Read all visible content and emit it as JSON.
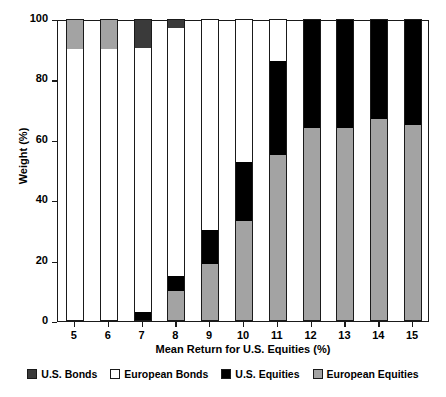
{
  "chart_data": {
    "type": "bar",
    "title": "",
    "subtitle": "",
    "xlabel": "Mean Return for U.S. Equities (%)",
    "ylabel": "Weight (%)",
    "stacked": true,
    "stack_normalized_to": 100,
    "grid": false,
    "legend_position": "bottom",
    "xlim": [
      4.5,
      15.5
    ],
    "ylim": [
      0,
      100
    ],
    "ytick_labels": [
      "0",
      "20",
      "40",
      "60",
      "80",
      "100"
    ],
    "ytick_values": [
      0,
      20,
      40,
      60,
      80,
      100
    ],
    "categories": [
      "5",
      "6",
      "7",
      "8",
      "9",
      "10",
      "11",
      "12",
      "13",
      "14",
      "15"
    ],
    "series": [
      {
        "name": "U.S. Bonds",
        "color": "#3a3a3a",
        "values": [
          0,
          0,
          9.5,
          3,
          0,
          0,
          0,
          0,
          0,
          0,
          0
        ]
      },
      {
        "name": "European Bonds",
        "color": "#ffffff",
        "values": [
          90,
          90,
          87.5,
          82,
          70,
          47.5,
          14,
          0,
          0,
          0,
          0
        ]
      },
      {
        "name": "U.S. Equities",
        "color": "#000000",
        "values": [
          0,
          0,
          3,
          5,
          11,
          19.5,
          31,
          36,
          36,
          33,
          35
        ]
      },
      {
        "name": "European Equities",
        "color": "#a3a3a3",
        "values": [
          10,
          10,
          0,
          10,
          19,
          33,
          55,
          64,
          64,
          67,
          65
        ]
      }
    ],
    "stack_order_bottom_to_top": [
      "U.S. Equities",
      "European Equities",
      "European Bonds",
      "U.S. Bonds"
    ],
    "bar_stacks": [
      {
        "x": "5",
        "segments": [
          {
            "series": "European Bonds",
            "from": 0,
            "to": 90
          },
          {
            "series": "European Equities",
            "from": 90,
            "to": 100
          }
        ]
      },
      {
        "x": "6",
        "segments": [
          {
            "series": "European Bonds",
            "from": 0,
            "to": 90
          },
          {
            "series": "European Equities",
            "from": 90,
            "to": 100
          }
        ]
      },
      {
        "x": "7",
        "segments": [
          {
            "series": "U.S. Equities",
            "from": 0,
            "to": 3
          },
          {
            "series": "European Bonds",
            "from": 3,
            "to": 90.5
          },
          {
            "series": "U.S. Bonds",
            "from": 90.5,
            "to": 100
          }
        ]
      },
      {
        "x": "8",
        "segments": [
          {
            "series": "European Equities",
            "from": 0,
            "to": 10
          },
          {
            "series": "U.S. Equities",
            "from": 10,
            "to": 15
          },
          {
            "series": "European Bonds",
            "from": 15,
            "to": 97
          },
          {
            "series": "U.S. Bonds",
            "from": 97,
            "to": 100
          }
        ]
      },
      {
        "x": "9",
        "segments": [
          {
            "series": "European Equities",
            "from": 0,
            "to": 19
          },
          {
            "series": "U.S. Equities",
            "from": 19,
            "to": 30
          },
          {
            "series": "European Bonds",
            "from": 30,
            "to": 100
          }
        ]
      },
      {
        "x": "10",
        "segments": [
          {
            "series": "European Equities",
            "from": 0,
            "to": 33
          },
          {
            "series": "U.S. Equities",
            "from": 33,
            "to": 52.5
          },
          {
            "series": "European Bonds",
            "from": 52.5,
            "to": 100
          }
        ]
      },
      {
        "x": "11",
        "segments": [
          {
            "series": "European Equities",
            "from": 0,
            "to": 55
          },
          {
            "series": "U.S. Equities",
            "from": 55,
            "to": 86
          },
          {
            "series": "European Bonds",
            "from": 86,
            "to": 100
          }
        ]
      },
      {
        "x": "12",
        "segments": [
          {
            "series": "European Equities",
            "from": 0,
            "to": 64
          },
          {
            "series": "U.S. Equities",
            "from": 64,
            "to": 100
          }
        ]
      },
      {
        "x": "13",
        "segments": [
          {
            "series": "European Equities",
            "from": 0,
            "to": 64
          },
          {
            "series": "U.S. Equities",
            "from": 64,
            "to": 100
          }
        ]
      },
      {
        "x": "14",
        "segments": [
          {
            "series": "European Equities",
            "from": 0,
            "to": 67
          },
          {
            "series": "U.S. Equities",
            "from": 67,
            "to": 100
          }
        ]
      },
      {
        "x": "15",
        "segments": [
          {
            "series": "European Equities",
            "from": 0,
            "to": 65
          },
          {
            "series": "U.S. Equities",
            "from": 65,
            "to": 100
          }
        ]
      }
    ]
  },
  "legend": {
    "items": [
      {
        "label": "U.S. Bonds",
        "color": "#3a3a3a"
      },
      {
        "label": "European Bonds",
        "color": "#ffffff"
      },
      {
        "label": "U.S. Equities",
        "color": "#000000"
      },
      {
        "label": "European Equities",
        "color": "#a3a3a3"
      }
    ]
  },
  "colors": {
    "axis": "#1a1a1a",
    "background": "#ffffff",
    "us_bonds": "#3a3a3a",
    "european_bonds": "#ffffff",
    "us_equities": "#000000",
    "european_equities": "#a3a3a3"
  }
}
